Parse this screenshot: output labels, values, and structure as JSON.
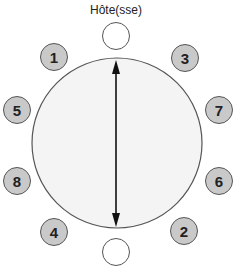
{
  "diagram": {
    "host_label": "Hôte(sse)",
    "colors": {
      "table_fill": "#f4f4f4",
      "table_stroke": "#555555",
      "seat_fill": "#c9c9c9",
      "seat_stroke": "#555555",
      "end_seat_fill": "#ffffff",
      "arrow": "#111111"
    },
    "table": {
      "shape": "round",
      "cx": 117,
      "cy": 143,
      "r": 85
    },
    "end_seats": [
      {
        "id": "host",
        "label": "",
        "cx": 116,
        "cy": 36
      },
      {
        "id": "opposite-host",
        "label": "",
        "cx": 116,
        "cy": 252
      }
    ],
    "seats": [
      {
        "number": "1",
        "cx": 54,
        "cy": 57
      },
      {
        "number": "3",
        "cx": 185,
        "cy": 58
      },
      {
        "number": "5",
        "cx": 17,
        "cy": 110
      },
      {
        "number": "7",
        "cx": 219,
        "cy": 110
      },
      {
        "number": "8",
        "cx": 17,
        "cy": 181
      },
      {
        "number": "6",
        "cx": 219,
        "cy": 181
      },
      {
        "number": "4",
        "cx": 54,
        "cy": 232
      },
      {
        "number": "2",
        "cx": 184,
        "cy": 231
      }
    ],
    "arrow": {
      "type": "double-headed",
      "x": 116,
      "y1": 60,
      "y2": 227
    }
  }
}
